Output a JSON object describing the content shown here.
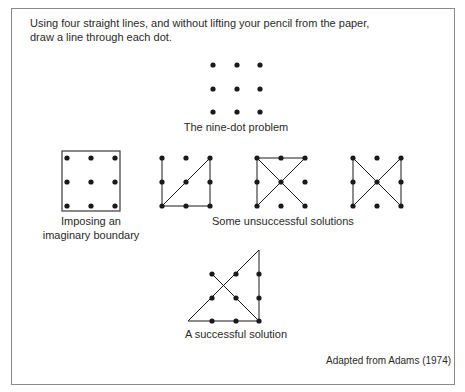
{
  "instructions": {
    "line1": "Using  four straight lines, and without lifting your pencil from the paper,",
    "line2": "draw a line through each dot."
  },
  "figures": {
    "nine_dot": {
      "caption": "The nine-dot problem"
    },
    "boundary": {
      "caption_line1": "Imposing an",
      "caption_line2": "imaginary boundary"
    },
    "unsuccessful": {
      "caption": "Some unsuccessful solutions"
    },
    "successful": {
      "caption": "A successful solution"
    }
  },
  "credit": "Adapted from Adams (1974)",
  "colors": {
    "ink": "#1a1a1a",
    "border": "#8a8a8a",
    "text": "#2a2a2a"
  }
}
